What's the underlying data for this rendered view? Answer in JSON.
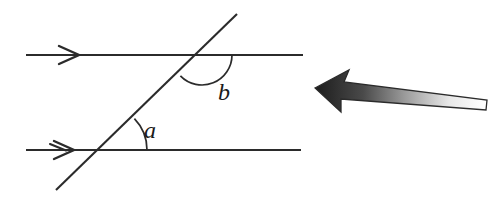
{
  "figure": {
    "type": "geometry-diagram",
    "background_color": "#ffffff",
    "line_color": "#2b2b2b"
  },
  "labels": {
    "angle_a": "a",
    "angle_b": "b"
  },
  "geometry": {
    "parallel_lines": [
      {
        "name": "upper-parallel-line",
        "x1": 26,
        "y1": 55,
        "x2": 303,
        "y2": 55,
        "direction_marker": "single-chevron-right",
        "marker_x": 72,
        "marker_y": 55
      },
      {
        "name": "lower-parallel-line",
        "x1": 26,
        "y1": 150,
        "x2": 301,
        "y2": 150,
        "direction_marker": "single-chevron-right",
        "marker_x": 66,
        "marker_y": 150
      }
    ],
    "transversal": {
      "name": "transversal-line",
      "x1": 56,
      "y1": 190,
      "x2": 237,
      "y2": 14
    },
    "intersections": [
      {
        "name": "upper-intersection",
        "x": 202,
        "y": 55
      },
      {
        "name": "lower-intersection",
        "x": 102,
        "y": 150
      }
    ],
    "arcs": [
      {
        "name": "angle-b-arc",
        "center_x": 202,
        "center_y": 55,
        "radius": 30,
        "start_angle_deg": 0,
        "end_angle_deg": 136,
        "label": "b",
        "label_x": 224,
        "label_y": 100
      },
      {
        "name": "angle-a-arc",
        "center_x": 102,
        "center_y": 150,
        "radius": 45,
        "start_angle_deg": 0,
        "end_angle_deg": 44,
        "label": "a",
        "label_x": 146,
        "label_y": 138
      }
    ]
  },
  "pointer": {
    "name": "pointer-arrow",
    "description": "gradient-filled arrow pointing left",
    "tip_x": 315,
    "tip_y": 88,
    "tail_x": 487,
    "tail_y": 108,
    "fill_start_color": "#1c1c1c",
    "fill_end_color": "#ffffff",
    "stroke_color": "#2b2b2b"
  }
}
